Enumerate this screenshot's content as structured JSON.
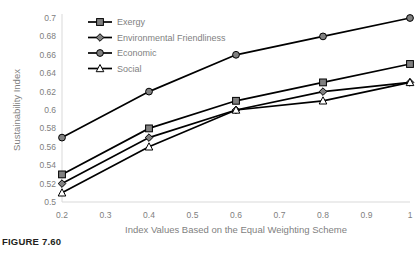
{
  "figure": {
    "caption": "FIGURE 7.60"
  },
  "chart_data": {
    "type": "line",
    "title": "",
    "xlabel": "Index Values Based on the Equal Weighting Scheme",
    "ylabel": "Sustainability Index",
    "x": [
      0.2,
      0.4,
      0.6,
      0.8,
      1
    ],
    "xlim": [
      0.2,
      1
    ],
    "ylim": [
      0.5,
      0.7
    ],
    "xticks": [
      "0.2",
      "0.3",
      "0.4",
      "0.5",
      "0.6",
      "0.7",
      "0.8",
      "0.9",
      "1"
    ],
    "xtick_values": [
      0.2,
      0.3,
      0.4,
      0.5,
      0.6,
      0.7,
      0.8,
      0.9,
      1
    ],
    "yticks": [
      "0.5",
      "0.52",
      "0.54",
      "0.56",
      "0.58",
      "0.6",
      "0.62",
      "0.64",
      "0.66",
      "0.68",
      "0.7"
    ],
    "ytick_values": [
      0.5,
      0.52,
      0.54,
      0.56,
      0.58,
      0.6,
      0.62,
      0.64,
      0.66,
      0.68,
      0.7
    ],
    "grid": false,
    "legend_position": "top-left",
    "series": [
      {
        "name": "Exergy",
        "marker": "square",
        "marker_fill": "#808080",
        "values": [
          0.53,
          0.58,
          0.61,
          0.63,
          0.65
        ]
      },
      {
        "name": "Environmental Friendliness",
        "marker": "diamond",
        "marker_fill": "#808080",
        "values": [
          0.52,
          0.57,
          0.6,
          0.62,
          0.63
        ]
      },
      {
        "name": "Economic",
        "marker": "circle",
        "marker_fill": "#808080",
        "values": [
          0.57,
          0.62,
          0.66,
          0.68,
          0.7
        ]
      },
      {
        "name": "Social",
        "marker": "triangle",
        "marker_fill": "#ffffff",
        "values": [
          0.51,
          0.56,
          0.6,
          0.61,
          0.63
        ]
      }
    ],
    "colors": {
      "line": "#000000",
      "marker_edge": "#000000",
      "axis": "#d9d9d9",
      "text": "#7f7f7f"
    }
  }
}
